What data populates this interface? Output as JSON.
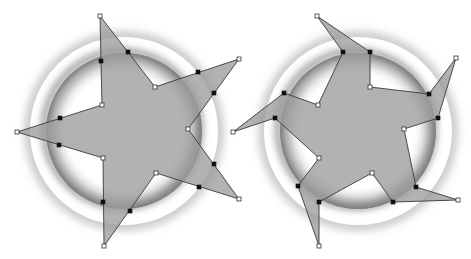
{
  "figure": {
    "width": 471,
    "height": 259,
    "background": "#ffffff",
    "fill_color": "#9c9c9c",
    "stroke_color": "#3a3a3a"
  },
  "panels": [
    {
      "name": "straight-star",
      "ring": {
        "cx": 124,
        "cy": 131,
        "r_outer": 92,
        "r_inner": 78
      },
      "outline_points": [
        [
          100,
          16
        ],
        [
          155,
          87
        ],
        [
          239,
          59
        ],
        [
          188,
          129
        ],
        [
          239,
          199
        ],
        [
          156,
          173
        ],
        [
          104,
          246
        ],
        [
          103,
          158
        ],
        [
          17,
          132
        ],
        [
          102,
          105
        ]
      ],
      "vertex_handles": [
        [
          100,
          16
        ],
        [
          155,
          87
        ],
        [
          239,
          59
        ],
        [
          188,
          129
        ],
        [
          239,
          199
        ],
        [
          156,
          173
        ],
        [
          104,
          246
        ],
        [
          103,
          158
        ],
        [
          17,
          132
        ],
        [
          102,
          105
        ]
      ],
      "control_handles": [
        [
          101,
          61
        ],
        [
          128,
          52
        ],
        [
          198,
          72
        ],
        [
          214,
          93
        ],
        [
          214,
          164
        ],
        [
          199,
          187
        ],
        [
          130,
          211
        ],
        [
          103,
          202
        ],
        [
          59,
          145
        ],
        [
          60,
          118
        ]
      ]
    },
    {
      "name": "pinwheel-star",
      "ring": {
        "cx": 358,
        "cy": 131,
        "r_outer": 92,
        "r_inner": 78
      },
      "outline_points": [
        [
          317,
          16
        ],
        [
          370,
          52
        ],
        [
          370,
          87
        ],
        [
          429,
          94
        ],
        [
          456,
          58
        ],
        [
          438,
          118
        ],
        [
          404,
          129
        ],
        [
          416,
          187
        ],
        [
          458,
          200
        ],
        [
          393,
          202
        ],
        [
          372,
          173
        ],
        [
          319,
          202
        ],
        [
          319,
          246
        ],
        [
          298,
          186
        ],
        [
          319,
          158
        ],
        [
          275,
          118
        ],
        [
          233,
          132
        ],
        [
          284,
          93
        ],
        [
          318,
          105
        ],
        [
          343,
          52
        ]
      ],
      "vertex_handles": [
        [
          317,
          16
        ],
        [
          370,
          87
        ],
        [
          456,
          58
        ],
        [
          404,
          129
        ],
        [
          458,
          200
        ],
        [
          372,
          173
        ],
        [
          319,
          246
        ],
        [
          319,
          158
        ],
        [
          233,
          132
        ],
        [
          318,
          105
        ]
      ],
      "control_handles": [
        [
          343,
          52
        ],
        [
          370,
          52
        ],
        [
          429,
          94
        ],
        [
          438,
          118
        ],
        [
          416,
          187
        ],
        [
          393,
          202
        ],
        [
          319,
          202
        ],
        [
          298,
          186
        ],
        [
          275,
          118
        ],
        [
          284,
          93
        ]
      ]
    }
  ]
}
